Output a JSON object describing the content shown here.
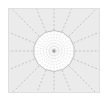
{
  "figure": {
    "title": "Radial Spoke Diagram",
    "panel_background": "#ebebeb",
    "panel_border": "#e0e0e0",
    "canvas_background": "#ffffff",
    "inner_disc_fill": "#fdfdfd",
    "inner_disc_stroke": "#b8b8b8",
    "spoke_color": "#bfbfbf",
    "inner_spoke_color": "#d2d2d2",
    "hub_color": "#9a9a9a",
    "hub_label": "center-hub"
  },
  "chart_data": {
    "type": "scatter",
    "title": "Radial Spoke Diagram",
    "subtitle": "",
    "xlabel": "",
    "ylabel": "",
    "grid": false,
    "legend": null,
    "center": {
      "x": 46,
      "y": 43
    },
    "inner_radius": 21,
    "outer_spoke_count": 16,
    "inner_spoke_count": 32,
    "outer_spoke_angles_deg": [
      0,
      22.5,
      45,
      67.5,
      90,
      112.5,
      135,
      157.5,
      180,
      202.5,
      225,
      247.5,
      270,
      292.5,
      315,
      337.5
    ],
    "inner_spoke_angles_deg": [
      0,
      11.25,
      22.5,
      33.75,
      45,
      56.25,
      67.5,
      78.75,
      90,
      101.25,
      112.5,
      123.75,
      135,
      146.25,
      157.5,
      168.75,
      180,
      191.25,
      202.5,
      213.75,
      225,
      236.25,
      247.5,
      258.75,
      270,
      281.25,
      292.5,
      303.75,
      315,
      326.25,
      337.5,
      348.75
    ],
    "disc_polygon_sides": 14,
    "dash_pattern": "2,2",
    "values": [],
    "categories": []
  }
}
